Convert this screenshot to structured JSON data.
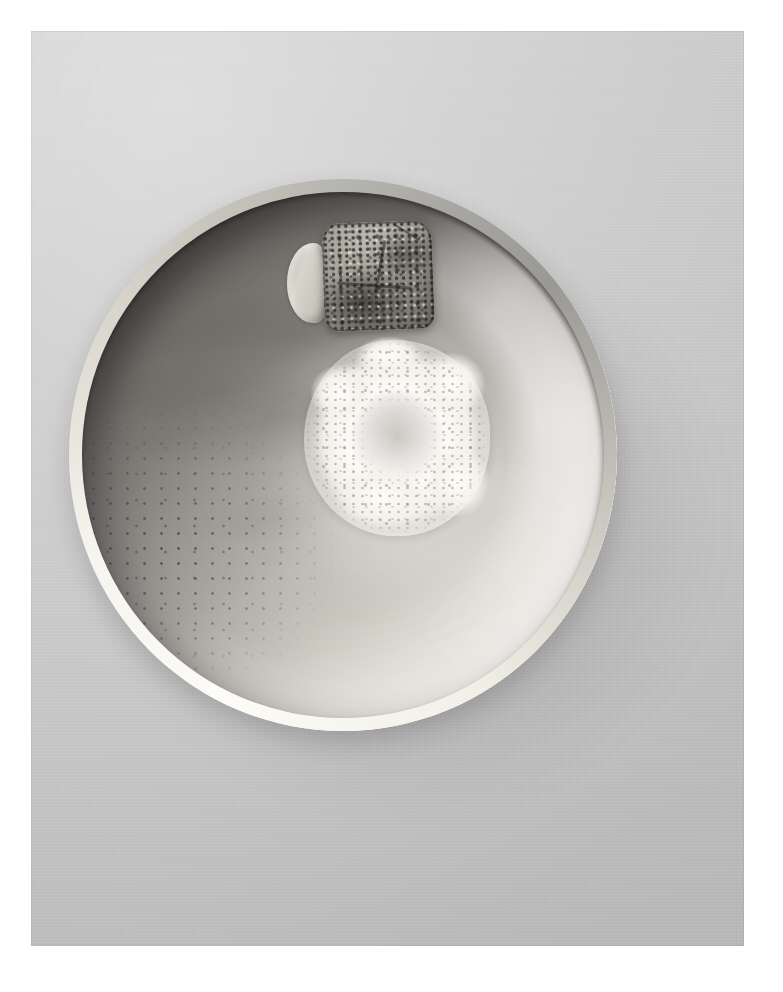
{
  "image": {
    "domain": "natural-image",
    "subject": "overhead-photograph-of-ceramic-bowl-with-seared-morsel-in-foam",
    "orientation": "portrait",
    "color_mode": "black-and-white",
    "canvas": {
      "width": 783,
      "height": 992,
      "background_hex": "#ffffff"
    },
    "plate": {
      "name": "photographic-print",
      "left": 31,
      "top": 31,
      "width": 713,
      "height": 915,
      "surface_hex": "#c9c9c9",
      "surface_description": "flat neutral gray paper-like tabletop with faint canvas tooth"
    },
    "margin": {
      "name": "white-print-border",
      "color_hex": "#ffffff",
      "left": 31,
      "top": 31,
      "right": 39,
      "bottom": 46
    }
  },
  "bowl": {
    "name": "ceramic-bowl",
    "left": 69,
    "top": 179,
    "width": 548,
    "height": 552,
    "rim_highlight_hex": "#fbfaf6",
    "shadow_side_hex": "#5e5d5b",
    "lit_side_hex": "#f4f2ec",
    "cavity_description": "deep round cavity, shadowed at upper-left, brightly lit glaze at lower-right, mottled brush-swirl glaze",
    "speckle_description": "scattered dark specks on shadowed lower-left wall",
    "cast_shadow_hex": "#000000",
    "cast_shadow_opacity": 0.14
  },
  "broth": {
    "name": "broth-pool",
    "tint_hex": "#f5f3ec",
    "description": "shallow pale liquid pooled at the centre of the bowl"
  },
  "foam": {
    "name": "foam-ring",
    "left": 266,
    "top": 192,
    "width": 186,
    "height": 196,
    "color_hex": "#fbfaf6",
    "bubble_hex": "#78766f",
    "description": "irregular ring of fine white froth encircling the centre morsel"
  },
  "morsels": [
    {
      "name": "seared-morsel",
      "left": 323,
      "top": 222,
      "width": 110,
      "height": 108,
      "base_hex": "#a39e93",
      "crust_hex": "#262420",
      "description": "squared piece of food with dark charred, heavily speckled sear crust and two faint score lines"
    },
    {
      "name": "pale-morsel",
      "left": 287,
      "top": 243,
      "width": 44,
      "height": 80,
      "base_hex": "#c9c6bd",
      "description": "smooth pale rounded element tucked against the left side of the seared morsel"
    }
  ],
  "lighting": {
    "name": "lighting-setup",
    "key_direction": "upper-left soft",
    "fill_direction": "lower-right bounce",
    "description": "soft diffuse key from upper-left throwing the bowl's near wall into shadow while the far wall catches bright reflected light"
  }
}
